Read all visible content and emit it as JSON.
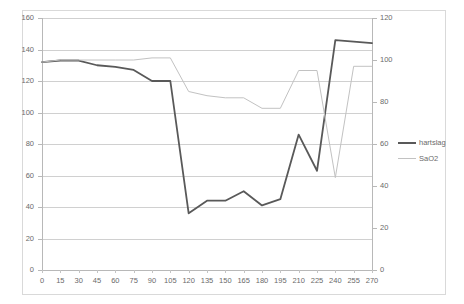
{
  "chart_data": {
    "type": "line",
    "title": "",
    "xlabel": "",
    "ylabel": "",
    "x": [
      0,
      15,
      30,
      45,
      60,
      75,
      90,
      105,
      120,
      135,
      150,
      165,
      180,
      195,
      210,
      225,
      240,
      255,
      270
    ],
    "xlim": [
      0,
      270
    ],
    "ylim": [
      0,
      160
    ],
    "y2lim": [
      0,
      120
    ],
    "grid": true,
    "legend_position": "right",
    "series": [
      {
        "name": "hartslag",
        "axis": "left",
        "color": "#595959",
        "values": [
          132,
          133,
          133,
          130,
          129,
          127,
          120,
          120,
          36,
          44,
          44,
          50,
          41,
          45,
          86,
          63,
          146,
          145,
          144
        ]
      },
      {
        "name": "SaO2",
        "axis": "right",
        "color": "#c2c2c2",
        "values": [
          99,
          100,
          100,
          100,
          100,
          100,
          101,
          101,
          85,
          83,
          82,
          82,
          77,
          77,
          95,
          95,
          44,
          97,
          97
        ]
      }
    ],
    "y_axis_left": {
      "ticks": [
        0,
        20,
        40,
        60,
        80,
        100,
        120,
        140,
        160
      ],
      "min": 0,
      "max": 160
    },
    "y_axis_right": {
      "ticks": [
        0,
        20,
        40,
        60,
        80,
        100,
        120
      ],
      "min": 0,
      "max": 120
    },
    "x_axis": {
      "ticks": [
        0,
        15,
        30,
        45,
        60,
        75,
        90,
        105,
        120,
        135,
        150,
        165,
        180,
        195,
        210,
        225,
        240,
        255,
        270
      ]
    },
    "legend": [
      {
        "label": "hartslag",
        "color": "#595959"
      },
      {
        "label": "SaO2",
        "color": "#c2c2c2"
      }
    ]
  }
}
